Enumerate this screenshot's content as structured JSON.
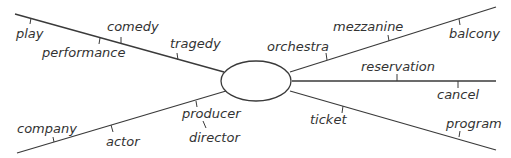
{
  "center": {
    "label": ""
  },
  "branches": {
    "upper_left": {
      "labels": {
        "play": "play",
        "performance": "performance",
        "comedy": "comedy",
        "tragedy": "tragedy"
      }
    },
    "lower_left": {
      "labels": {
        "company": "company",
        "actor": "actor",
        "producer": "producer",
        "director": "director"
      }
    },
    "upper_right": {
      "labels": {
        "orchestra": "orchestra",
        "mezzanine": "mezzanine",
        "balcony": "balcony"
      }
    },
    "middle_right": {
      "labels": {
        "reservation": "reservation",
        "cancel": "cancel"
      }
    },
    "lower_right": {
      "labels": {
        "ticket": "ticket",
        "program": "program"
      }
    }
  },
  "colors": {
    "line": "#3a3a3a",
    "text": "#333333",
    "background": "#ffffff"
  }
}
